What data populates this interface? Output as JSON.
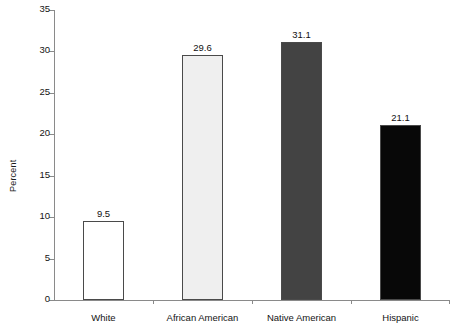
{
  "chart_data": {
    "type": "bar",
    "title": "",
    "xlabel": "",
    "ylabel": "Percent",
    "categories": [
      "White",
      "African American",
      "Native American",
      "Hispanic"
    ],
    "values": [
      9.5,
      29.6,
      31.1,
      21.1
    ],
    "value_labels": [
      "9.5",
      "29.6",
      "31.1",
      "21.1"
    ],
    "ylim": [
      0,
      35
    ],
    "ytick_values": [
      0,
      5,
      10,
      15,
      20,
      25,
      30,
      35
    ],
    "ytick_labels": [
      "0",
      "5",
      "10",
      "15",
      "20",
      "25",
      "30",
      "35"
    ],
    "grid": false,
    "legend": null,
    "bar_colors": [
      "#ffffff",
      "#efefef",
      "#434343",
      "#080808"
    ],
    "bar_border_color": "#4a4a4a",
    "axis_color": "#8a8a8a"
  }
}
